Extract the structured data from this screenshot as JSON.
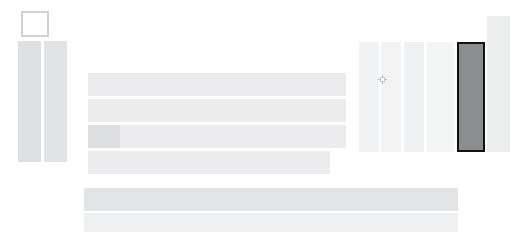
{
  "page": {
    "title": "",
    "background_color": "#ffffff",
    "width": 527,
    "height": 247,
    "appearance_note": "Extremely low-contrast / washed-out rendering; all text is near-invisible light gray on light gray."
  },
  "colors": {
    "page_background": "#ffffff",
    "block_light": "#f3f3f4",
    "block_mid": "#ececee",
    "block_gray": "#dfe0e2",
    "selected_fill": "#8c8d8f",
    "selected_border": "#111213",
    "logo_border": "#cfd1d4",
    "cursor": "#b9babc"
  },
  "logo": {
    "label": "",
    "icon": "square-outline-icon"
  },
  "left_columns": [
    {
      "label": "",
      "fill": "#dfe0e2"
    },
    {
      "label": "",
      "fill": "#e2e3e5"
    }
  ],
  "middle_rows": [
    {
      "label": "",
      "fill": "#ececee",
      "has_chip": false,
      "chip_label": ""
    },
    {
      "label": "",
      "fill": "#ececee",
      "has_chip": false,
      "chip_label": ""
    },
    {
      "label": "",
      "fill": "#ececee",
      "has_chip": true,
      "chip_label": ""
    },
    {
      "label": "",
      "fill": "#ececee",
      "has_chip": false,
      "chip_label": ""
    }
  ],
  "bottom_bars": [
    {
      "label": "",
      "fill": "#e3e4e6"
    },
    {
      "label": "",
      "fill": "#eff0f1"
    }
  ],
  "right_columns": [
    {
      "label": "",
      "fill": "#f1f2f3",
      "selected": false
    },
    {
      "label": "",
      "fill": "#f3f3f4",
      "selected": false
    },
    {
      "label": "",
      "fill": "#f0f1f2",
      "selected": false
    },
    {
      "label": "",
      "fill": "#f4f5f5",
      "selected": false
    }
  ],
  "selected_column": {
    "label": "",
    "fill": "#8c8d8f",
    "border_color": "#111213",
    "selected": true
  },
  "right_tall_column": {
    "label": "",
    "fill": "#eceded"
  },
  "cursor": {
    "icon": "crosshair-cursor-icon",
    "x": 382,
    "y": 79
  }
}
